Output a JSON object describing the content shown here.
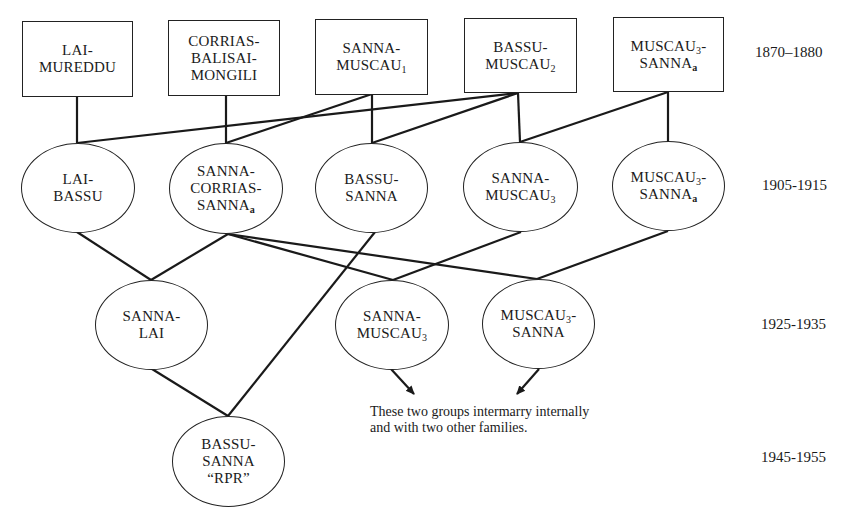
{
  "diagram": {
    "type": "family-lineage",
    "generations": [
      {
        "period": "1870–1880",
        "shape": "box",
        "nodes": [
          {
            "id": "g1_lai_mureddu",
            "lines": [
              "LAI-",
              "MUREDDU"
            ]
          },
          {
            "id": "g1_corrias",
            "lines": [
              "CORRIAS-",
              "BALISAI-",
              "MONGILI"
            ]
          },
          {
            "id": "g1_sanna_muscau1",
            "lines": [
              "SANNA-",
              "MUSCAU",
              "1"
            ]
          },
          {
            "id": "g1_bassu_muscau2",
            "lines": [
              "BASSU-",
              "MUSCAU",
              "2"
            ]
          },
          {
            "id": "g1_muscau3_sannaa",
            "lines": [
              "MUSCAU",
              "3",
              "-",
              "SANNA",
              "a"
            ]
          }
        ]
      },
      {
        "period": "1905-1915",
        "shape": "ellipse",
        "nodes": [
          {
            "id": "g2_lai_bassu",
            "lines": [
              "LAI-",
              "BASSU"
            ]
          },
          {
            "id": "g2_sanna_corrias_sannaa",
            "lines": [
              "SANNA-",
              "CORRIAS-",
              "SANNA",
              "a"
            ]
          },
          {
            "id": "g2_bassu_sanna",
            "lines": [
              "BASSU-",
              "SANNA"
            ]
          },
          {
            "id": "g2_sanna_muscau3",
            "lines": [
              "SANNA-",
              "MUSCAU",
              "3"
            ]
          },
          {
            "id": "g2_muscau3_sannaa",
            "lines": [
              "MUSCAU",
              "3",
              "-",
              "SANNA",
              "a"
            ]
          }
        ]
      },
      {
        "period": "1925-1935",
        "shape": "ellipse",
        "nodes": [
          {
            "id": "g3_sanna_lai",
            "lines": [
              "SANNA-",
              "LAI"
            ]
          },
          {
            "id": "g3_sanna_muscau3",
            "lines": [
              "SANNA-",
              "MUSCAU",
              "3"
            ]
          },
          {
            "id": "g3_muscau3_sanna",
            "lines": [
              "MUSCAU",
              "3",
              "-",
              "SANNA"
            ]
          }
        ]
      },
      {
        "period": "1945-1955",
        "shape": "ellipse",
        "nodes": [
          {
            "id": "g4_bassu_sanna_rpr",
            "lines": [
              "BASSU-",
              "SANNA",
              "“RPR”"
            ]
          }
        ]
      }
    ],
    "edges": [
      [
        "g1_lai_mureddu",
        "g2_lai_bassu"
      ],
      [
        "g1_bassu_muscau2",
        "g2_lai_bassu"
      ],
      [
        "g1_corrias",
        "g2_sanna_corrias_sannaa"
      ],
      [
        "g1_sanna_muscau1",
        "g2_sanna_corrias_sannaa"
      ],
      [
        "g1_sanna_muscau1",
        "g2_bassu_sanna"
      ],
      [
        "g1_bassu_muscau2",
        "g2_bassu_sanna"
      ],
      [
        "g1_bassu_muscau2",
        "g2_sanna_muscau3"
      ],
      [
        "g1_muscau3_sannaa",
        "g2_sanna_muscau3"
      ],
      [
        "g1_muscau3_sannaa",
        "g2_muscau3_sannaa"
      ],
      [
        "g2_lai_bassu",
        "g3_sanna_lai"
      ],
      [
        "g2_sanna_corrias_sannaa",
        "g3_sanna_lai"
      ],
      [
        "g2_sanna_corrias_sannaa",
        "g3_sanna_muscau3"
      ],
      [
        "g2_sanna_corrias_sannaa",
        "g3_muscau3_sanna"
      ],
      [
        "g2_sanna_muscau3",
        "g3_sanna_muscau3"
      ],
      [
        "g2_muscau3_sannaa",
        "g3_muscau3_sanna"
      ],
      [
        "g3_sanna_lai",
        "g4_bassu_sanna_rpr"
      ],
      [
        "g2_bassu_sanna",
        "g4_bassu_sanna_rpr"
      ]
    ],
    "arrows": [
      [
        "g3_sanna_muscau3",
        "note"
      ],
      [
        "g3_muscau3_sanna",
        "note"
      ]
    ],
    "note": "These two groups intermarry internally and with two other families.",
    "colors": {
      "ink": "#1a1a1a",
      "background": "#ffffff"
    }
  }
}
